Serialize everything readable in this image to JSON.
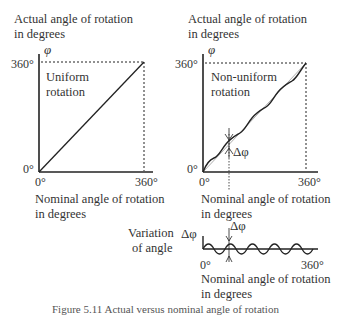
{
  "figure": {
    "caption": "Figure 5.11  Actual versus nominal angle of rotation",
    "left_panel": {
      "y_axis_label_line1": "Actual angle of rotation",
      "y_axis_label_line2": "in degrees",
      "y_symbol": "φ",
      "y_tick_top": "360°",
      "y_tick_bottom": "0°",
      "x_tick_left": "0°",
      "x_tick_right": "360°",
      "x_axis_label_line1": "Nominal angle of rotation",
      "x_axis_label_line2": "in degrees",
      "annotation_line1": "Uniform",
      "annotation_line2": "rotation"
    },
    "right_panel": {
      "y_axis_label_line1": "Actual angle of rotation",
      "y_axis_label_line2": "in degrees",
      "y_symbol": "φ",
      "y_tick_top": "360°",
      "y_tick_bottom": "0°",
      "x_tick_left": "0°",
      "x_tick_right": "360°",
      "x_axis_label_line1": "Nominal angle of rotation",
      "x_axis_label_line2": "in degrees",
      "annotation_line1": "Non-uniform",
      "annotation_line2": "rotation",
      "delta_label": "Δφ"
    },
    "variation_panel": {
      "label_line1": "Variation",
      "label_line2": "of angle",
      "y_symbol": "Δφ",
      "delta_label": "Δφ",
      "x_tick_left": "0°",
      "x_tick_right": "360°",
      "x_axis_label_line1": "Nominal angle of rotation",
      "x_axis_label_line2": "in degrees"
    }
  }
}
